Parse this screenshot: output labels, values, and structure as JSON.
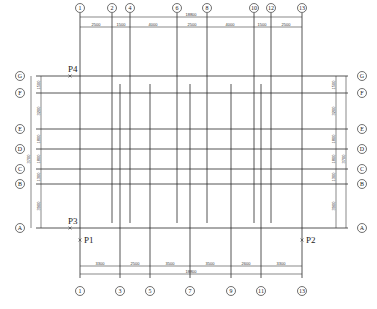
{
  "drawing": {
    "type": "structural axis grid plan",
    "top_axes": [
      {
        "label": "1",
        "x": 80
      },
      {
        "label": "2",
        "x": 112
      },
      {
        "label": "4",
        "x": 130
      },
      {
        "label": "6",
        "x": 177
      },
      {
        "label": "8",
        "x": 207
      },
      {
        "label": "10",
        "x": 254
      },
      {
        "label": "12",
        "x": 271
      },
      {
        "label": "13",
        "x": 302
      }
    ],
    "top_dims_total": {
      "value": "18800",
      "x": 191
    },
    "top_dims": [
      {
        "value": "2500",
        "x": 96
      },
      {
        "value": "1500",
        "x": 121
      },
      {
        "value": "4000",
        "x": 153
      },
      {
        "value": "2500",
        "x": 192
      },
      {
        "value": "4000",
        "x": 230
      },
      {
        "value": "1500",
        "x": 262
      },
      {
        "value": "2500",
        "x": 286
      }
    ],
    "bottom_axes": [
      {
        "label": "1",
        "x": 80
      },
      {
        "label": "3",
        "x": 120
      },
      {
        "label": "5",
        "x": 150
      },
      {
        "label": "7",
        "x": 190
      },
      {
        "label": "9",
        "x": 231
      },
      {
        "label": "11",
        "x": 261
      },
      {
        "label": "13",
        "x": 302
      }
    ],
    "bottom_dims": [
      {
        "value": "3300",
        "x": 100
      },
      {
        "value": "2500",
        "x": 135
      },
      {
        "value": "3500",
        "x": 170
      },
      {
        "value": "3500",
        "x": 210
      },
      {
        "value": "2600",
        "x": 246
      },
      {
        "value": "3300",
        "x": 281
      }
    ],
    "bottom_dims_total": {
      "value": "18800",
      "x": 191
    },
    "side_axes": [
      {
        "label": "G",
        "y": 76
      },
      {
        "label": "F",
        "y": 93
      },
      {
        "label": "E",
        "y": 129
      },
      {
        "label": "D",
        "y": 149
      },
      {
        "label": "C",
        "y": 169
      },
      {
        "label": "B",
        "y": 184
      },
      {
        "label": "A",
        "y": 228
      }
    ],
    "side_dims": [
      {
        "value": "1500",
        "y": 85
      },
      {
        "value": "3200",
        "y": 111
      },
      {
        "value": "1800",
        "y": 139
      },
      {
        "value": "1800",
        "y": 159
      },
      {
        "value": "1300",
        "y": 177
      },
      {
        "value": "3900",
        "y": 206
      }
    ],
    "side_dims_combined": {
      "value": "3700",
      "y": 159
    },
    "points": [
      {
        "label": "P4",
        "x": 70,
        "y": 76
      },
      {
        "label": "P3",
        "x": 70,
        "y": 228
      },
      {
        "label": "P1",
        "x": 80,
        "y": 240
      },
      {
        "label": "P2",
        "x": 302,
        "y": 240
      }
    ]
  }
}
